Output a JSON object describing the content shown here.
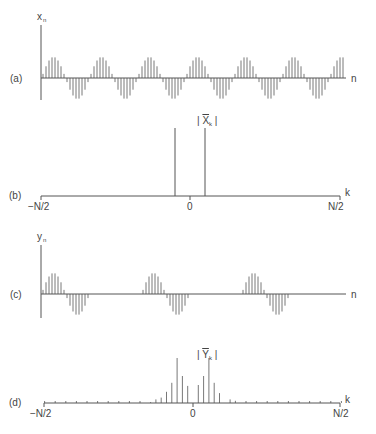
{
  "chart_data": [
    {
      "panel": "(a)",
      "type": "stem",
      "ylabel": "x_n",
      "xlabel": "n",
      "description": "Continuous sampled sinusoid (windowed cosine-like), ~6.3 periods, ~16 samples per period",
      "periods_visible": 6.3,
      "samples_per_period": 16,
      "amplitude": 1.0
    },
    {
      "panel": "(b)",
      "type": "stem",
      "ylabel": "|X̄_k|",
      "xlabel": "k",
      "xticks": [
        "−N/2",
        "0",
        "N/2"
      ],
      "description": "Two equal spectral lines symmetric about k=0",
      "lines": [
        {
          "k_rel": -0.1,
          "magnitude": 1.0
        },
        {
          "k_rel": 0.1,
          "magnitude": 1.0
        }
      ]
    },
    {
      "panel": "(c)",
      "type": "stem",
      "ylabel": "y_n",
      "xlabel": "n",
      "description": "Gated sinusoid: bursts of one period separated by zero gaps; 3 bursts visible",
      "bursts": 3,
      "samples_per_period": 16
    },
    {
      "panel": "(d)",
      "type": "stem",
      "ylabel": "|Ȳ_k|",
      "xlabel": "k",
      "xticks": [
        "−N/2",
        "0",
        "N/2"
      ],
      "description": "Spectrum of gated sinusoid: main peaks at ±k0 with decaying sidelobes",
      "values_rel": [
        {
          "k": -8,
          "m": 0.02
        },
        {
          "k": -7,
          "m": 0.08
        },
        {
          "k": -6,
          "m": 0.12
        },
        {
          "k": -5,
          "m": 0.25
        },
        {
          "k": -4,
          "m": 0.45
        },
        {
          "k": -3,
          "m": 1.0
        },
        {
          "k": -2,
          "m": 0.6
        },
        {
          "k": -1,
          "m": 0.38
        },
        {
          "k": 1,
          "m": 0.4
        },
        {
          "k": 2,
          "m": 0.6
        },
        {
          "k": 3,
          "m": 1.0
        },
        {
          "k": 4,
          "m": 0.45
        },
        {
          "k": 5,
          "m": 0.22
        },
        {
          "k": 7,
          "m": 0.08
        },
        {
          "k": 8,
          "m": 0.05
        }
      ]
    }
  ],
  "labels": {
    "a": "(a)",
    "b": "(b)",
    "c": "(c)",
    "d": "(d)",
    "xn": "x",
    "xn_sub": "n",
    "yn": "y",
    "yn_sub": "n",
    "n_axis": "n",
    "k_axis": "k",
    "Xk": "X",
    "Xk_sub": "k",
    "Yk": "Y",
    "Yk_sub": "k",
    "neg_n2": "−N/2",
    "zero": "0",
    "pos_n2": "N/2"
  },
  "colors": {
    "ink": "#555555",
    "background": "#ffffff"
  }
}
